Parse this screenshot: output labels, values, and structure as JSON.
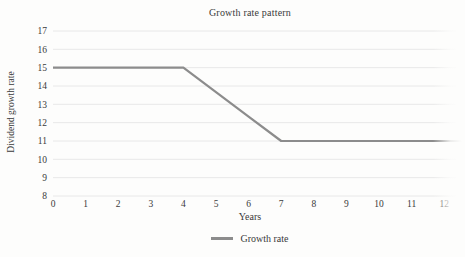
{
  "chart_data": {
    "type": "line",
    "title": "Growth rate pattern",
    "xlabel": "Years",
    "ylabel": "Dividend growth rate",
    "x_ticks": [
      "0",
      "1",
      "2",
      "3",
      "4",
      "5",
      "6",
      "7",
      "8",
      "9",
      "10",
      "11",
      "12"
    ],
    "y_ticks": [
      "8",
      "9",
      "10",
      "11",
      "12",
      "13",
      "14",
      "15",
      "16",
      "17"
    ],
    "xlim": [
      0,
      12.6
    ],
    "ylim": [
      8,
      17
    ],
    "grid": "horizontal-gridlines-only",
    "legend_position": "bottom-center",
    "series": [
      {
        "name": "Growth rate",
        "color": "#8c8c8c",
        "x": [
          0,
          1,
          2,
          3,
          4,
          5,
          6,
          7,
          8,
          9,
          10,
          11,
          12
        ],
        "values": [
          15,
          15,
          15,
          15,
          15,
          13.67,
          12.33,
          11,
          11,
          11,
          11,
          11,
          11
        ],
        "line_extends_to_x": 12.6
      }
    ],
    "colors": {
      "grid": "#e8e8e8",
      "text": "#3a3a3a",
      "background": "#fdfdfc"
    }
  }
}
